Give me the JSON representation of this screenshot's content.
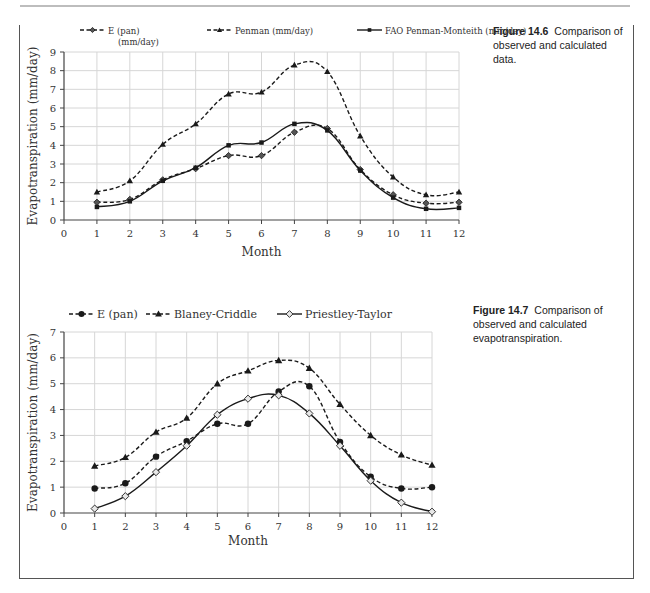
{
  "figures": [
    {
      "caption_label": "Figure 14.6",
      "caption_text": "Comparison of observed and calculated data."
    },
    {
      "caption_label": "Figure 14.7",
      "caption_text": "Comparison of observed and calculated evapotranspiration."
    }
  ],
  "chart_data": [
    {
      "type": "line",
      "title": "",
      "xlabel": "Month",
      "ylabel": "Evapotranspiration (mm/day)",
      "x": [
        1,
        2,
        3,
        4,
        5,
        6,
        7,
        8,
        9,
        10,
        11,
        12
      ],
      "xlim": [
        0,
        12
      ],
      "ylim": [
        0,
        9
      ],
      "x_ticks": [
        0,
        1,
        2,
        3,
        4,
        5,
        6,
        7,
        8,
        9,
        10,
        11,
        12
      ],
      "y_ticks": [
        0,
        1,
        2,
        3,
        4,
        5,
        6,
        7,
        8,
        9
      ],
      "grid": true,
      "legend_position": "top",
      "series": [
        {
          "name": "E (pan) (mm/day)",
          "legend_lines": [
            "E (pan)",
            "(mm/day)"
          ],
          "marker": "diamond",
          "dash": true,
          "values": [
            0.95,
            1.1,
            2.15,
            2.75,
            3.45,
            3.45,
            4.7,
            4.9,
            2.7,
            1.35,
            0.9,
            0.95
          ]
        },
        {
          "name": "Penman (mm/day)",
          "legend_lines": [
            "Penman (mm/day)"
          ],
          "marker": "triangle",
          "dash": true,
          "values": [
            1.5,
            2.1,
            4.05,
            5.15,
            6.75,
            6.85,
            8.3,
            7.95,
            4.5,
            2.3,
            1.35,
            1.5
          ]
        },
        {
          "name": "FAO Penman-Monteith (mm/day)",
          "legend_lines": [
            "FAO Penman-Monteith (mm/day)"
          ],
          "marker": "square",
          "dash": false,
          "values": [
            0.7,
            1.0,
            2.1,
            2.8,
            4.0,
            4.15,
            5.15,
            4.8,
            2.65,
            1.2,
            0.6,
            0.65
          ]
        }
      ]
    },
    {
      "type": "line",
      "title": "",
      "xlabel": "Month",
      "ylabel": "Evapotranspiration (mm/day)",
      "x": [
        1,
        2,
        3,
        4,
        5,
        6,
        7,
        8,
        9,
        10,
        11,
        12
      ],
      "xlim": [
        0,
        12
      ],
      "ylim": [
        0,
        7
      ],
      "x_ticks": [
        0,
        1,
        2,
        3,
        4,
        5,
        6,
        7,
        8,
        9,
        10,
        11,
        12
      ],
      "y_ticks": [
        0,
        1,
        2,
        3,
        4,
        5,
        6,
        7
      ],
      "grid": true,
      "legend_position": "top",
      "series": [
        {
          "name": "E (pan)",
          "legend_lines": [
            "E (pan)"
          ],
          "marker": "circle",
          "dash": true,
          "values": [
            0.95,
            1.15,
            2.18,
            2.78,
            3.45,
            3.45,
            4.7,
            4.9,
            2.75,
            1.4,
            0.95,
            1.0
          ]
        },
        {
          "name": "Blaney-Criddle",
          "legend_lines": [
            "Blaney-Criddle"
          ],
          "marker": "triangle",
          "dash": true,
          "values": [
            1.82,
            2.15,
            3.13,
            3.67,
            5.0,
            5.5,
            5.9,
            5.6,
            4.2,
            3.0,
            2.25,
            1.85
          ]
        },
        {
          "name": "Priestley-Taylor",
          "legend_lines": [
            "Priestley-Taylor"
          ],
          "marker": "open-diamond",
          "dash": false,
          "values": [
            0.17,
            0.65,
            1.58,
            2.6,
            3.8,
            4.42,
            4.55,
            3.85,
            2.6,
            1.25,
            0.4,
            0.05
          ]
        }
      ]
    }
  ]
}
